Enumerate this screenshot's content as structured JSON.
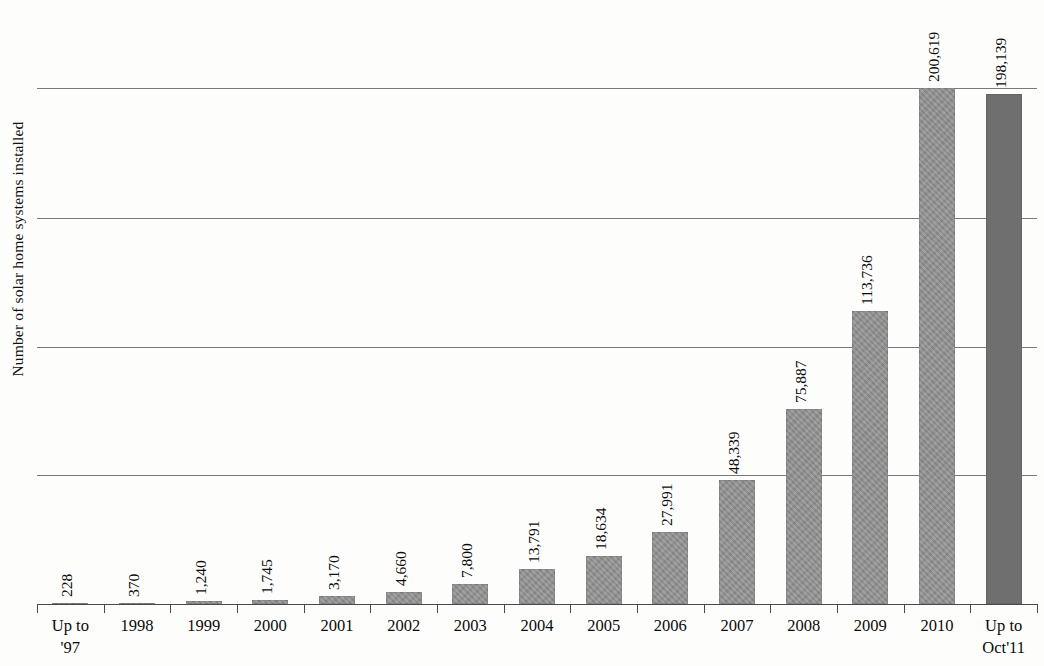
{
  "chart_data": {
    "type": "bar",
    "title": "",
    "subtitle": "",
    "xlabel": "",
    "ylabel": "Number of solar home systems installed",
    "ylim": [
      0,
      200619
    ],
    "grid": true,
    "gridline_values": [
      50000,
      100000,
      150000,
      200619
    ],
    "legend": "none",
    "axis_tick_labels_y": [],
    "bar_color": "#8e8e8e",
    "last_bar_color": "#6f6f6f",
    "categories": [
      "Up to '97",
      "1998",
      "1999",
      "2000",
      "2001",
      "2002",
      "2003",
      "2004",
      "2005",
      "2006",
      "2007",
      "2008",
      "2009",
      "2010",
      "Up to Oct'11"
    ],
    "category_lines": [
      [
        "Up to",
        "'97"
      ],
      [
        "1998",
        ""
      ],
      [
        "1999",
        ""
      ],
      [
        "2000",
        ""
      ],
      [
        "2001",
        ""
      ],
      [
        "2002",
        ""
      ],
      [
        "2003",
        ""
      ],
      [
        "2004",
        ""
      ],
      [
        "2005",
        ""
      ],
      [
        "2006",
        ""
      ],
      [
        "2007",
        ""
      ],
      [
        "2008",
        ""
      ],
      [
        "2009",
        ""
      ],
      [
        "2010",
        ""
      ],
      [
        "Up to",
        "Oct'11"
      ]
    ],
    "values": [
      228,
      370,
      1240,
      1745,
      3170,
      4660,
      7800,
      13791,
      18634,
      27991,
      48339,
      75887,
      113736,
      200619,
      198139
    ],
    "value_labels": [
      "228",
      "370",
      "1,240",
      "1,745",
      "3,170",
      "4,660",
      "7,800",
      "13,791",
      "18,634",
      "27,991",
      "48,339",
      "75,887",
      "113,736",
      "200,619",
      "198,139"
    ]
  }
}
